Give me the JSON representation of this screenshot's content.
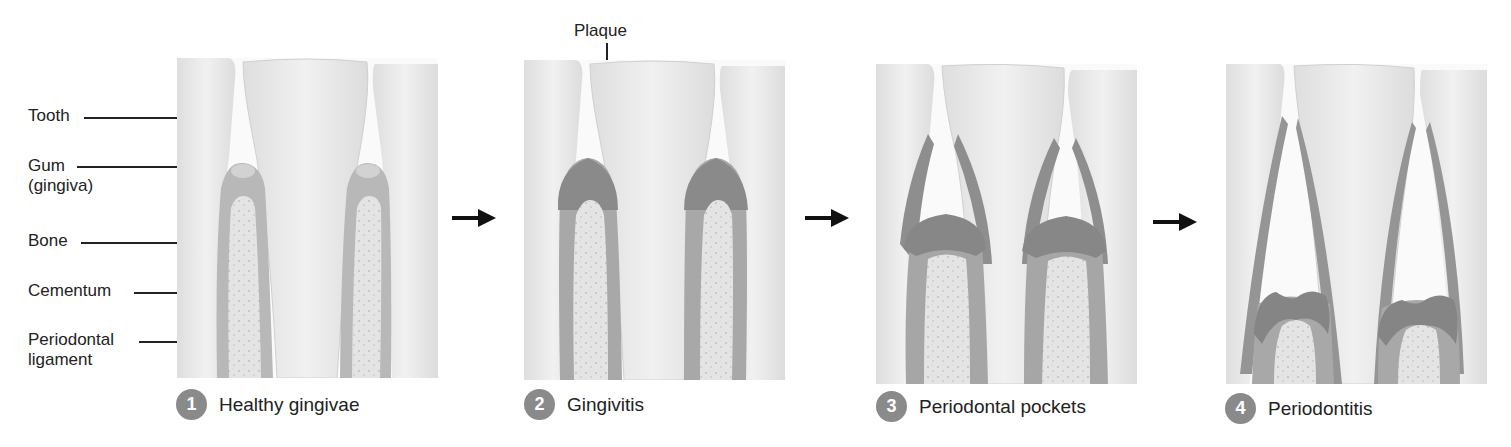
{
  "figure": {
    "colors": {
      "tooth": "#ececec",
      "tooth_edge": "#d4d4d4",
      "gum_healthy": "#b9b9b9",
      "gum_inflamed": "#8c8c8c",
      "bone": "#e2e2e2",
      "bone_dots": "#c4c4c4",
      "badge": "#8a8a8a",
      "arrow": "#111111"
    }
  },
  "anatomy_labels": {
    "tooth": "Tooth",
    "gum_line1": "Gum",
    "gum_line2": "(gingiva)",
    "bone": "Bone",
    "cementum": "Cementum",
    "ligament_line1": "Periodontal",
    "ligament_line2": "ligament"
  },
  "plaque_label": "Plaque",
  "stages": [
    {
      "number": "1",
      "label": "Healthy gingivae"
    },
    {
      "number": "2",
      "label": "Gingivitis"
    },
    {
      "number": "3",
      "label": "Periodontal pockets"
    },
    {
      "number": "4",
      "label": "Periodontitis"
    }
  ],
  "arrows": [
    "arrow-right",
    "arrow-right",
    "arrow-right"
  ]
}
